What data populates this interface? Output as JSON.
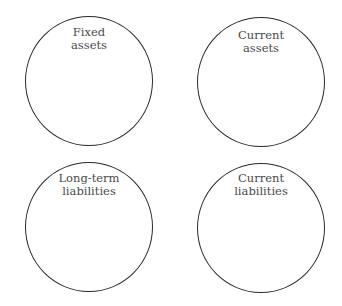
{
  "diagram": {
    "type": "four-circle-grid",
    "circles": [
      {
        "id": "fixed-assets",
        "position": "top-left",
        "label_lines": [
          "Fixed",
          "assets"
        ]
      },
      {
        "id": "current-assets",
        "position": "top-right",
        "label_lines": [
          "Current",
          "assets"
        ]
      },
      {
        "id": "long-term-liabilities",
        "position": "bottom-left",
        "label_lines": [
          "Long-term",
          "liabilities"
        ]
      },
      {
        "id": "current-liabilities",
        "position": "bottom-right",
        "label_lines": [
          "Current",
          "liabilities"
        ]
      }
    ],
    "colors": {
      "stroke": "#2a2a2a",
      "text": "#4a4a4a",
      "background": "#ffffff"
    }
  }
}
